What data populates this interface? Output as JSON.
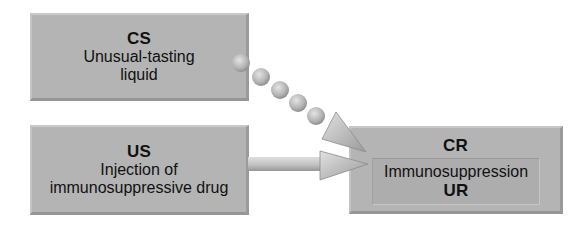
{
  "diagram": {
    "cs": {
      "abbr": "CS",
      "line1": "Unusual-tasting",
      "line2": "liquid"
    },
    "us": {
      "abbr": "US",
      "line1": "Injection of",
      "line2": "immunosuppressive drug"
    },
    "cr": {
      "abbr": "CR",
      "response": "Immunosuppression",
      "ur_abbr": "UR"
    },
    "arrows": [
      {
        "from": "CS",
        "to": "CR",
        "style": "dotted-beads"
      },
      {
        "from": "US",
        "to": "CR",
        "style": "solid-shaft"
      }
    ]
  },
  "colors": {
    "box_fill": "#b4b4b4",
    "inner_box_fill": "#adadad",
    "arrow_fill": "#bdbdbd",
    "text": "#111111"
  }
}
